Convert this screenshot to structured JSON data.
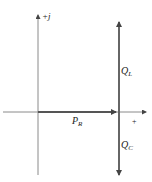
{
  "diagram": {
    "type": "phasor-power-diagram",
    "axes": {
      "vertical_label": "+j",
      "horizontal_label": "+"
    },
    "vectors": [
      {
        "name": "P",
        "subscript": "R",
        "direction": "right"
      },
      {
        "name": "Q",
        "subscript": "L",
        "direction": "up"
      },
      {
        "name": "Q",
        "subscript": "C",
        "direction": "down"
      }
    ],
    "colors": {
      "axis": "#8a8a8a",
      "vector": "#555555",
      "text": "#222222"
    }
  }
}
